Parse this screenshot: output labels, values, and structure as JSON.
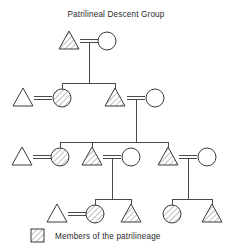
{
  "title": "Patrilineal Descent Group",
  "legend": {
    "label": "Members of the patrilineage",
    "swatch": "hatched-square-icon"
  },
  "colors": {
    "background": "#ffffff",
    "line": "#4a4a4a",
    "shape_stroke": "#3a3a3a",
    "shape_fill": "#ffffff",
    "hatch": "#7a7a7a",
    "text": "#2a2a2a"
  },
  "symbol_key": {
    "triangle": "male",
    "circle": "female",
    "hatched": "member-of-patrilineage",
    "plain": "not-member-of-patrilineage",
    "double_line": "marriage",
    "vertical_line": "descent",
    "horizontal_bar": "sibling-set"
  },
  "generations": [
    {
      "id": "generation-1",
      "label": "Generation 1",
      "y": 41,
      "nodes": [
        {
          "id": "g1-male",
          "sex": "male",
          "shape": "triangle",
          "lineage_member": true,
          "cx": 69,
          "cy": 41
        },
        {
          "id": "g1-female",
          "sex": "female",
          "shape": "circle",
          "lineage_member": false,
          "cx": 107,
          "cy": 41
        }
      ],
      "marriages": [
        {
          "id": "g1-marriage",
          "left": "g1-male",
          "right": "g1-female"
        }
      ]
    },
    {
      "id": "generation-2",
      "label": "Generation 2",
      "y": 98,
      "nodes": [
        {
          "id": "g2-in-married-male",
          "sex": "male",
          "shape": "triangle",
          "lineage_member": false,
          "cx": 23,
          "cy": 98
        },
        {
          "id": "g2-daughter",
          "sex": "female",
          "shape": "circle",
          "lineage_member": true,
          "cx": 62,
          "cy": 98
        },
        {
          "id": "g2-son",
          "sex": "male",
          "shape": "triangle",
          "lineage_member": true,
          "cx": 115,
          "cy": 98
        },
        {
          "id": "g2-in-married-female",
          "sex": "female",
          "shape": "circle",
          "lineage_member": false,
          "cx": 155,
          "cy": 98
        }
      ],
      "marriages": [
        {
          "id": "g2-marriage-left",
          "left": "g2-in-married-male",
          "right": "g2-daughter"
        },
        {
          "id": "g2-marriage-right",
          "left": "g2-son",
          "right": "g2-in-married-female"
        }
      ]
    },
    {
      "id": "generation-3",
      "label": "Generation 3",
      "y": 157,
      "nodes": [
        {
          "id": "g3-in-married-male",
          "sex": "male",
          "shape": "triangle",
          "lineage_member": false,
          "cx": 22,
          "cy": 157
        },
        {
          "id": "g3-daughter",
          "sex": "female",
          "shape": "circle",
          "lineage_member": true,
          "cx": 60,
          "cy": 157
        },
        {
          "id": "g3-son-a",
          "sex": "male",
          "shape": "triangle",
          "lineage_member": true,
          "cx": 92,
          "cy": 157
        },
        {
          "id": "g3-wife-a",
          "sex": "female",
          "shape": "circle",
          "lineage_member": false,
          "cx": 131,
          "cy": 157
        },
        {
          "id": "g3-son-b",
          "sex": "male",
          "shape": "triangle",
          "lineage_member": true,
          "cx": 168,
          "cy": 157
        },
        {
          "id": "g3-wife-b",
          "sex": "female",
          "shape": "circle",
          "lineage_member": false,
          "cx": 207,
          "cy": 157
        }
      ],
      "marriages": [
        {
          "id": "g3-marriage-left",
          "left": "g3-in-married-male",
          "right": "g3-daughter"
        },
        {
          "id": "g3-marriage-mid",
          "left": "g3-son-a",
          "right": "g3-wife-a"
        },
        {
          "id": "g3-marriage-right",
          "left": "g3-son-b",
          "right": "g3-wife-b"
        }
      ]
    },
    {
      "id": "generation-4",
      "label": "Generation 4",
      "y": 214,
      "nodes": [
        {
          "id": "g4-in-married-male",
          "sex": "male",
          "shape": "triangle",
          "lineage_member": false,
          "cx": 57,
          "cy": 214
        },
        {
          "id": "g4-daughter-left",
          "sex": "female",
          "shape": "circle",
          "lineage_member": true,
          "cx": 95,
          "cy": 214
        },
        {
          "id": "g4-son-left",
          "sex": "male",
          "shape": "triangle",
          "lineage_member": true,
          "cx": 131,
          "cy": 214
        },
        {
          "id": "g4-daughter-right",
          "sex": "female",
          "shape": "circle",
          "lineage_member": true,
          "cx": 172,
          "cy": 214
        },
        {
          "id": "g4-son-right",
          "sex": "male",
          "shape": "triangle",
          "lineage_member": true,
          "cx": 212,
          "cy": 214
        }
      ],
      "marriages": [
        {
          "id": "g4-marriage-left",
          "left": "g4-in-married-male",
          "right": "g4-daughter-left"
        }
      ]
    }
  ],
  "descent_links": [
    {
      "id": "descent-g1-to-g2",
      "from": "g1-marriage",
      "to_sibling_bar": "g2-sibling-bar"
    },
    {
      "id": "descent-g2-to-g3",
      "from": "g2-marriage-right",
      "to_sibling_bar": "g3-sibling-bar"
    },
    {
      "id": "descent-g3-to-g4-left",
      "from": "g3-marriage-mid",
      "to_sibling_bar": "g4-sibling-bar-left"
    },
    {
      "id": "descent-g3-to-g4-right",
      "from": "g3-marriage-right",
      "to_sibling_bar": "g4-sibling-bar-right"
    }
  ]
}
